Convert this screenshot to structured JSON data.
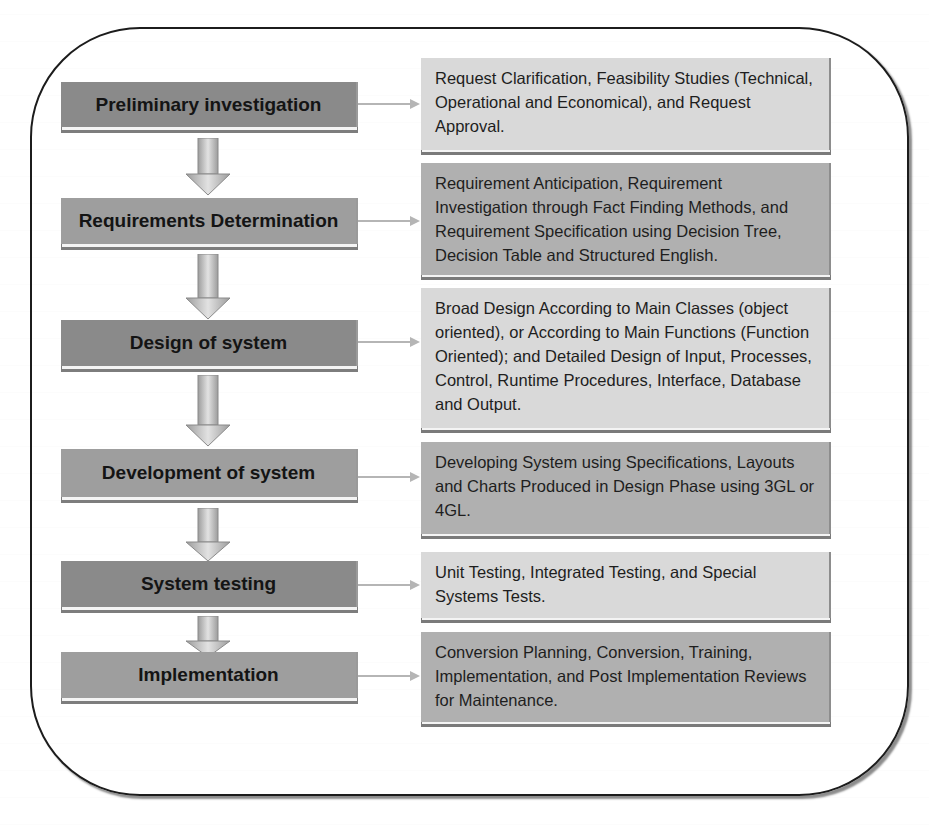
{
  "diagram": {
    "type": "flowchart",
    "title": "",
    "phases": [
      {
        "label": "Preliminary investigation",
        "description": "Request Clarification, Feasibility Studies (Technical, Operational and Economical), and Request Approval."
      },
      {
        "label": "Requirements Determination",
        "description": "Requirement Anticipation, Requirement Investigation through Fact Finding Methods, and Requirement Specification using Decision Tree, Decision Table and Structured English."
      },
      {
        "label": "Design of system",
        "description": "Broad Design According to Main Classes (object oriented), or According to Main Functions (Function Oriented); and Detailed Design of Input, Processes, Control, Runtime Procedures, Interface, Database and Output."
      },
      {
        "label": "Development of system",
        "description": "Developing System using Specifications, Layouts and Charts Produced in Design Phase using 3GL or 4GL."
      },
      {
        "label": "System testing",
        "description": "Unit Testing, Integrated Testing, and Special Systems Tests."
      },
      {
        "label": "Implementation",
        "description": "Conversion Planning, Conversion, Training, Implementation, and Post Implementation Reviews for Maintenance."
      }
    ],
    "colors": {
      "phase_dark": "#8a8a8a",
      "phase_mid": "#9e9e9e",
      "desc_light": "#d9d9d9",
      "desc_mid": "#b0b0b0",
      "frame_border": "#1c1c1c",
      "arrow": "#b5b5b5"
    }
  }
}
